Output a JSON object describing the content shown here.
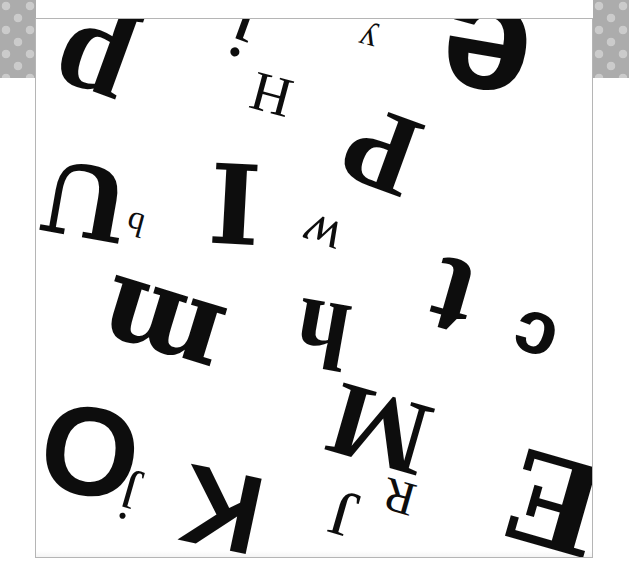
{
  "page": {
    "background_color": "#ffffff",
    "panel_color": "#ffffff",
    "border_color": "#b5b5b5",
    "ink_color": "#0d0d0d",
    "halftone_color": "#a8a8a8",
    "panel": {
      "left": 35,
      "top": 18,
      "width": 558,
      "height": 540
    }
  },
  "corners": [
    {
      "name": "halftone-corner-top-left",
      "position": "top-left"
    },
    {
      "name": "halftone-corner-top-right",
      "position": "top-right"
    }
  ],
  "glyphs": [
    {
      "char": "p",
      "x": 52,
      "y": 8,
      "size": 128,
      "rotate": 200,
      "style": "serif-b",
      "name": "glyph-p"
    },
    {
      "char": "j",
      "x": 230,
      "y": -14,
      "size": 86,
      "rotate": 200,
      "style": "serif",
      "name": "glyph-j-top"
    },
    {
      "char": "y",
      "x": 358,
      "y": 22,
      "size": 34,
      "rotate": 195,
      "style": "serif",
      "name": "glyph-y"
    },
    {
      "char": "e",
      "x": 440,
      "y": -22,
      "size": 160,
      "rotate": 190,
      "style": "sans-b",
      "name": "glyph-e"
    },
    {
      "char": "H",
      "x": 250,
      "y": 66,
      "size": 56,
      "rotate": 195,
      "style": "serif",
      "name": "glyph-h-capital"
    },
    {
      "char": "P",
      "x": 345,
      "y": 92,
      "size": 116,
      "rotate": 200,
      "style": "serif-b",
      "name": "glyph-p-capital"
    },
    {
      "char": "U",
      "x": 42,
      "y": 150,
      "size": 98,
      "rotate": 190,
      "style": "slab",
      "name": "glyph-u-capital"
    },
    {
      "char": "b",
      "x": 126,
      "y": 206,
      "size": 34,
      "rotate": 195,
      "style": "serif",
      "name": "glyph-b"
    },
    {
      "char": "I",
      "x": 208,
      "y": 150,
      "size": 110,
      "rotate": 3,
      "style": "slab",
      "name": "glyph-i-capital"
    },
    {
      "char": "w",
      "x": 302,
      "y": 208,
      "size": 56,
      "rotate": 200,
      "style": "serif ital",
      "name": "glyph-w-script"
    },
    {
      "char": "m",
      "x": 98,
      "y": 272,
      "size": 116,
      "rotate": 197,
      "style": "slab",
      "name": "glyph-m"
    },
    {
      "char": "h",
      "x": 295,
      "y": 285,
      "size": 96,
      "rotate": 190,
      "style": "serif-b",
      "name": "glyph-h"
    },
    {
      "char": "t",
      "x": 430,
      "y": 238,
      "size": 124,
      "rotate": 196,
      "style": "serif-b",
      "name": "glyph-t"
    },
    {
      "char": "c",
      "x": 512,
      "y": 300,
      "size": 76,
      "rotate": 198,
      "style": "sans-b",
      "name": "glyph-c"
    },
    {
      "char": "M",
      "x": 328,
      "y": 375,
      "size": 106,
      "rotate": 196,
      "style": "serif-b",
      "name": "glyph-m-capital"
    },
    {
      "char": "O",
      "x": 40,
      "y": 388,
      "size": 126,
      "rotate": 8,
      "style": "sans-b",
      "name": "glyph-o-capital"
    },
    {
      "char": "E",
      "x": 508,
      "y": 438,
      "size": 124,
      "rotate": 196,
      "style": "slab",
      "name": "glyph-e-capital"
    },
    {
      "char": "K",
      "x": 180,
      "y": 452,
      "size": 112,
      "rotate": 192,
      "style": "sans-b",
      "name": "glyph-k-capital"
    },
    {
      "char": "j",
      "x": 118,
      "y": 470,
      "size": 58,
      "rotate": 196,
      "style": "serif",
      "name": "glyph-j-bottom"
    },
    {
      "char": "J",
      "x": 330,
      "y": 480,
      "size": 66,
      "rotate": 196,
      "style": "serif",
      "name": "glyph-j-capital"
    },
    {
      "char": "R",
      "x": 382,
      "y": 472,
      "size": 48,
      "rotate": 196,
      "style": "serif",
      "name": "glyph-r-capital"
    }
  ]
}
